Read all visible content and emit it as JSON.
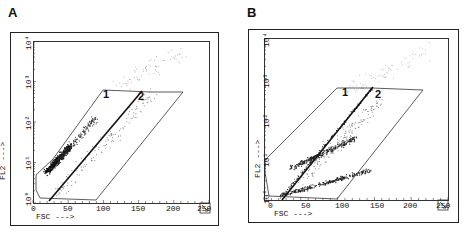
{
  "figure": {
    "panels": [
      {
        "letter": "A",
        "x_axis": {
          "label": "FSC --->",
          "ticks": [
            "0",
            "50",
            "100",
            "150",
            "200",
            "250"
          ],
          "range": [
            0,
            250
          ]
        },
        "y_axis": {
          "label": "FL2 --->",
          "ticks": [
            "10⁰",
            "10¹",
            "10²",
            "10³",
            "10⁴"
          ],
          "scale": "log",
          "range": [
            1,
            10000
          ]
        },
        "gate_labels": [
          "1",
          "2"
        ],
        "corner_mark": "R1",
        "corner_icon": "arrow-down-right"
      },
      {
        "letter": "B",
        "x_axis": {
          "label": "FSC --->",
          "ticks": [
            "0",
            "50",
            "100",
            "150",
            "200",
            "250"
          ],
          "range": [
            0,
            250
          ]
        },
        "y_axis": {
          "label": "FL2 --->",
          "ticks": [
            "10⁰",
            "10¹",
            "10²",
            "10³",
            "10⁴"
          ],
          "scale": "log",
          "range": [
            1,
            10000
          ]
        },
        "gate_labels": [
          "1",
          "2"
        ],
        "corner_mark": "R1",
        "corner_icon": "arrow-down-right"
      }
    ]
  },
  "chart_data": [
    {
      "type": "scatter",
      "title": "A",
      "xlabel": "FSC",
      "ylabel": "FL2",
      "xlim": [
        0,
        250
      ],
      "ylim": [
        1,
        10000
      ],
      "yscale": "log",
      "x_ticks": [
        0,
        50,
        100,
        150,
        200,
        250
      ],
      "y_ticks": [
        "10^0",
        "10^1",
        "10^2",
        "10^3",
        "10^4"
      ],
      "annotations": [
        "1",
        "2"
      ],
      "description": "Dense population concentrated in region 1 around FSC 20-80, FL2 ~10^0.8-10^2; sparse events in region 2"
    },
    {
      "type": "scatter",
      "title": "B",
      "xlabel": "FSC",
      "ylabel": "FL2",
      "xlim": [
        0,
        250
      ],
      "ylim": [
        1,
        10000
      ],
      "yscale": "log",
      "x_ticks": [
        0,
        50,
        100,
        150,
        200,
        250
      ],
      "y_ticks": [
        "10^0",
        "10^1",
        "10^2",
        "10^3",
        "10^4"
      ],
      "annotations": [
        "1",
        "2"
      ],
      "description": "Two diagonal populations: one in region 1 (upper band) and one in region 2 (lower band), both rising with FSC"
    }
  ]
}
